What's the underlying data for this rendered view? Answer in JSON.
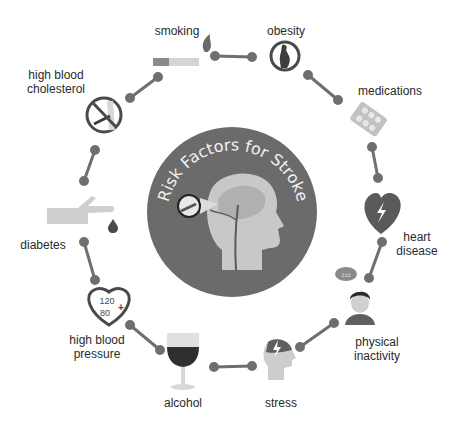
{
  "title": "Risk Factors for Stroke",
  "center": {
    "title": "Risk Factors for Stroke",
    "fill": "#6b6b6b",
    "head_fill": "#c8c8c8"
  },
  "colors": {
    "connector": "#6f6f6f",
    "dark": "#4a4a4a",
    "light": "#cfcfcf"
  },
  "factors": [
    {
      "id": "smoking",
      "label": "smoking",
      "icon": "cigarette-icon"
    },
    {
      "id": "obesity",
      "label": "obesity",
      "icon": "obesity-icon"
    },
    {
      "id": "medications",
      "label": "medications",
      "icon": "pills-icon"
    },
    {
      "id": "heart-disease",
      "label1": "heart",
      "label2": "disease",
      "icon": "heart-lightning-icon"
    },
    {
      "id": "physical-inactivity",
      "label1": "physical",
      "label2": "inactivity",
      "icon": "person-sleeping-icon",
      "bubble_text": "zzz"
    },
    {
      "id": "stress",
      "label": "stress",
      "icon": "head-lightning-icon"
    },
    {
      "id": "alcohol",
      "label": "alcohol",
      "icon": "wine-glass-icon"
    },
    {
      "id": "high-blood-pressure",
      "label1": "high blood",
      "label2": "pressure",
      "icon": "heart-blood-pressure-icon",
      "bp_top": "120",
      "bp_bottom": "80",
      "bp_symbol": "+"
    },
    {
      "id": "diabetes",
      "label": "diabetes",
      "icon": "hand-blood-drop-icon"
    },
    {
      "id": "high-blood-cholesterol",
      "label1": "high blood",
      "label2": "cholesterol",
      "icon": "clogged-artery-icon"
    }
  ]
}
